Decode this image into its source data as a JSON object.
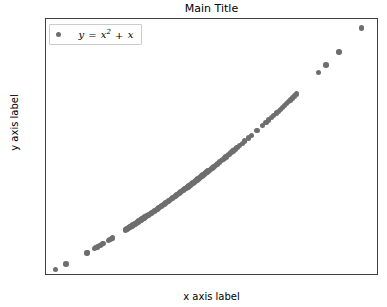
{
  "chart_data": {
    "type": "scatter",
    "title": "Main Title",
    "xlabel": "x axis label",
    "ylabel": "y axis label",
    "xlim": [
      0.5,
      1.81
    ],
    "ylim": [
      0.72,
      4.92
    ],
    "xticks": [
      "0.6",
      "0.8",
      "1.0",
      "1.2",
      "1.4",
      "1.6",
      "1.8"
    ],
    "xtick_values": [
      0.6,
      0.8,
      1.0,
      1.2,
      1.4,
      1.6,
      1.8
    ],
    "yticks": [
      "1.0",
      "1.5",
      "2.0",
      "2.5",
      "3.0",
      "3.5",
      "4.0",
      "4.5"
    ],
    "ytick_values": [
      1.0,
      1.5,
      2.0,
      2.5,
      3.0,
      3.5,
      4.0,
      4.5
    ],
    "grid": false,
    "legend_position": "upper left",
    "marker_color": "#6e6e6e",
    "marker_size": 5.4,
    "series": [
      {
        "name": "y = x^2 + x",
        "legend_label_parts": {
          "lhs": "y",
          "eq": "=",
          "base": "x",
          "exponent": "2",
          "plus": "+",
          "tail": "x"
        },
        "x": [
          0.538,
          0.579,
          0.661,
          0.664,
          0.69,
          0.697,
          0.703,
          0.712,
          0.718,
          0.724,
          0.745,
          0.751,
          0.757,
          0.762,
          0.812,
          0.815,
          0.818,
          0.822,
          0.826,
          0.83,
          0.834,
          0.838,
          0.842,
          0.846,
          0.85,
          0.854,
          0.858,
          0.862,
          0.866,
          0.87,
          0.874,
          0.878,
          0.882,
          0.886,
          0.89,
          0.894,
          0.898,
          0.902,
          0.906,
          0.91,
          0.914,
          0.918,
          0.922,
          0.926,
          0.93,
          0.934,
          0.938,
          0.942,
          0.946,
          0.95,
          0.954,
          0.958,
          0.962,
          0.966,
          0.97,
          0.974,
          0.978,
          0.982,
          0.986,
          0.99,
          0.994,
          0.998,
          1.002,
          1.006,
          1.01,
          1.014,
          1.018,
          1.022,
          1.026,
          1.03,
          1.034,
          1.038,
          1.042,
          1.046,
          1.05,
          1.054,
          1.058,
          1.062,
          1.066,
          1.07,
          1.074,
          1.078,
          1.082,
          1.086,
          1.09,
          1.094,
          1.098,
          1.102,
          1.106,
          1.11,
          1.114,
          1.118,
          1.122,
          1.126,
          1.13,
          1.134,
          1.138,
          1.142,
          1.146,
          1.15,
          1.154,
          1.158,
          1.162,
          1.166,
          1.17,
          1.174,
          1.183,
          1.19,
          1.196,
          1.202,
          1.208,
          1.214,
          1.22,
          1.228,
          1.236,
          1.244,
          1.252,
          1.262,
          1.272,
          1.282,
          1.296,
          1.308,
          1.33,
          1.352,
          1.366,
          1.376,
          1.386,
          1.396,
          1.406,
          1.414,
          1.422,
          1.43,
          1.438,
          1.446,
          1.454,
          1.462,
          1.47,
          1.478,
          1.486,
          1.572,
          1.602,
          1.652,
          1.742
        ],
        "y_formula": "x^2 + x",
        "y": [
          0.827,
          0.914,
          1.098,
          1.105,
          1.166,
          1.183,
          1.197,
          1.219,
          1.234,
          1.248,
          1.3,
          1.315,
          1.33,
          1.343,
          1.471,
          1.479,
          1.487,
          1.498,
          1.508,
          1.519,
          1.53,
          1.54,
          1.551,
          1.562,
          1.573,
          1.583,
          1.594,
          1.605,
          1.616,
          1.627,
          1.638,
          1.649,
          1.66,
          1.671,
          1.682,
          1.693,
          1.704,
          1.716,
          1.727,
          1.738,
          1.749,
          1.761,
          1.772,
          1.784,
          1.795,
          1.806,
          1.818,
          1.83,
          1.841,
          1.853,
          1.864,
          1.876,
          1.888,
          1.899,
          1.911,
          1.923,
          1.935,
          1.947,
          1.958,
          1.97,
          1.982,
          1.994,
          2.006,
          2.018,
          2.03,
          2.042,
          2.055,
          2.067,
          2.079,
          2.091,
          2.103,
          2.116,
          2.128,
          2.14,
          2.153,
          2.165,
          2.177,
          2.19,
          2.202,
          2.215,
          2.228,
          2.24,
          2.253,
          2.265,
          2.278,
          2.291,
          2.304,
          2.316,
          2.329,
          2.342,
          2.355,
          2.368,
          2.381,
          2.394,
          2.407,
          2.42,
          2.433,
          2.446,
          2.459,
          2.473,
          2.486,
          2.499,
          2.512,
          2.526,
          2.539,
          2.552,
          2.582,
          2.606,
          2.626,
          2.647,
          2.668,
          2.689,
          2.708,
          2.736,
          2.764,
          2.792,
          2.82,
          2.855,
          2.89,
          2.926,
          2.976,
          3.019,
          3.099,
          3.18,
          3.232,
          3.269,
          3.307,
          3.345,
          3.383,
          3.413,
          3.444,
          3.475,
          3.506,
          3.537,
          3.568,
          3.599,
          3.631,
          3.662,
          3.694,
          4.043,
          4.169,
          4.381,
          4.776
        ]
      }
    ]
  }
}
